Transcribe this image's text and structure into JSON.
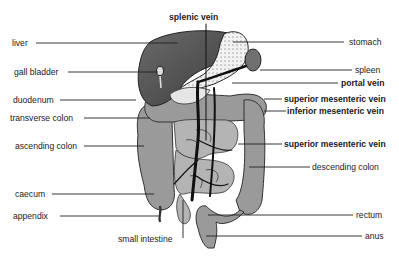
{
  "diagram": {
    "type": "anatomical-labeled-illustration",
    "colors": {
      "background": "#ffffff",
      "liver": "#5a5a5a",
      "organ_gray": "#9a9a9a",
      "stomach": "#f4f4f4",
      "spleen": "#707070",
      "vein": "#111111",
      "leader_line": "#222222",
      "text": "#1a1a1a"
    },
    "labels_left": [
      {
        "id": "liver",
        "text": "liver",
        "bold": false
      },
      {
        "id": "gall-bladder",
        "text": "gall bladder",
        "bold": false
      },
      {
        "id": "duodenum",
        "text": "duodenum",
        "bold": false
      },
      {
        "id": "transverse-colon",
        "text": "transverse colon",
        "bold": false
      },
      {
        "id": "ascending-colon",
        "text": "ascending colon",
        "bold": false
      },
      {
        "id": "caecum",
        "text": "caecum",
        "bold": false
      },
      {
        "id": "appendix",
        "text": "appendix",
        "bold": false
      }
    ],
    "labels_top": [
      {
        "id": "splenic-vein",
        "text": "splenic vein",
        "bold": true
      }
    ],
    "labels_bottom": [
      {
        "id": "small-intestine",
        "text": "small intestine",
        "bold": false
      }
    ],
    "labels_right": [
      {
        "id": "stomach",
        "text": "stomach",
        "bold": false
      },
      {
        "id": "spleen",
        "text": "spleen",
        "bold": false
      },
      {
        "id": "portal-vein",
        "text": "portal vein",
        "bold": true
      },
      {
        "id": "superior-mesenteric-vein-1",
        "text": "superior mesenteric vein",
        "bold": true
      },
      {
        "id": "inferior-mesenteric-vein",
        "text": "inferior mesenteric vein",
        "bold": true
      },
      {
        "id": "superior-mesenteric-vein-2",
        "text": "superior mesenteric vein",
        "bold": true
      },
      {
        "id": "descending-colon",
        "text": "descending colon",
        "bold": false
      },
      {
        "id": "rectum",
        "text": "rectum",
        "bold": false
      },
      {
        "id": "anus",
        "text": "anus",
        "bold": false
      }
    ]
  }
}
